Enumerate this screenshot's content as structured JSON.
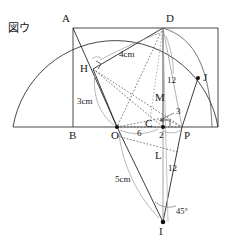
{
  "figure": {
    "tag": "図ウ",
    "caption_position": "top-left"
  },
  "colors": {
    "stroke_solid": "#262626",
    "stroke_dashed": "#555555",
    "stroke_gray": "#9a9a9a",
    "point_fill": "#111111",
    "background": "#ffffff"
  },
  "points": [
    {
      "id": "A",
      "label": "A",
      "x": 73,
      "y": 27,
      "dot": false,
      "label_dx": -11,
      "label_dy": -13
    },
    {
      "id": "D",
      "label": "D",
      "x": 163,
      "y": 28,
      "dot": false,
      "label_dx": 3,
      "label_dy": -14
    },
    {
      "id": "H",
      "label": "H",
      "x": 93,
      "y": 69,
      "dot": false,
      "label_dx": -12,
      "label_dy": -5
    },
    {
      "id": "J",
      "label": "J",
      "x": 198,
      "y": 78,
      "dot": true,
      "label_dx": 4,
      "label_dy": -5
    },
    {
      "id": "M",
      "label": "M",
      "x": 160,
      "y": 104,
      "dot": false,
      "label_dx": -4,
      "label_dy": -12
    },
    {
      "id": "C",
      "label": "C",
      "x": 156,
      "y": 126,
      "dot": true,
      "label_dx": -11,
      "label_dy": -5
    },
    {
      "id": "B",
      "label": "B",
      "x": 73,
      "y": 127,
      "dot": false,
      "label_dx": -4,
      "label_dy": 3
    },
    {
      "id": "O",
      "label": "O",
      "x": 117,
      "y": 127,
      "dot": true,
      "label_dx": -5,
      "label_dy": 3
    },
    {
      "id": "P",
      "label": "P",
      "x": 182,
      "y": 127,
      "dot": false,
      "label_dx": 3,
      "label_dy": 3
    },
    {
      "id": "L",
      "label": "L",
      "x": 158,
      "y": 158,
      "dot": false,
      "label_dx": -3,
      "label_dy": -5
    },
    {
      "id": "I",
      "label": "I",
      "x": 163,
      "y": 222,
      "dot": true,
      "label_dx": -3,
      "label_dy": 4
    }
  ],
  "measurements": [
    {
      "id": "m-4cm",
      "text": "4cm",
      "x": 122,
      "y": 56,
      "kind": "length"
    },
    {
      "id": "m-3cm",
      "text": "3cm",
      "x": 84,
      "y": 102,
      "kind": "length"
    },
    {
      "id": "m-5cm",
      "text": "5cm",
      "x": 122,
      "y": 180,
      "kind": "length"
    },
    {
      "id": "m-12up",
      "text": "12",
      "x": 170,
      "y": 81,
      "kind": "length"
    },
    {
      "id": "m-3",
      "text": "3",
      "x": 175,
      "y": 112,
      "kind": "length"
    },
    {
      "id": "m-6",
      "text": "6",
      "x": 138,
      "y": 133,
      "kind": "length"
    },
    {
      "id": "m-2",
      "text": "2",
      "x": 159,
      "y": 134,
      "kind": "length"
    },
    {
      "id": "m-12dn",
      "text": "12",
      "x": 170,
      "y": 168,
      "kind": "length"
    },
    {
      "id": "m-45",
      "text": "45°",
      "x": 175,
      "y": 211,
      "kind": "angle"
    }
  ],
  "marks": {
    "right_angle_at_H": true,
    "right_angle_at_C": true,
    "angle_arc_at_I": true
  },
  "segments": {
    "solid": [
      {
        "name": "baseline",
        "from": "left-end",
        "to": "right-end"
      },
      {
        "name": "AB-vertical"
      },
      {
        "name": "AD-top"
      },
      {
        "name": "AO"
      },
      {
        "name": "DH"
      },
      {
        "name": "HO"
      },
      {
        "name": "DC-vertical"
      },
      {
        "name": "DP-arc-chord"
      },
      {
        "name": "OI"
      },
      {
        "name": "PI"
      },
      {
        "name": "CI"
      },
      {
        "name": "PJ"
      }
    ],
    "dashed": [
      {
        "name": "DO"
      },
      {
        "name": "HC"
      },
      {
        "name": "HM"
      },
      {
        "name": "MP"
      },
      {
        "name": "OL"
      },
      {
        "name": "LP"
      },
      {
        "name": "DL"
      },
      {
        "name": "CP-short"
      }
    ],
    "arcs": [
      {
        "name": "semicircle-main"
      },
      {
        "name": "arc-DJ-small"
      },
      {
        "name": "brace-HO-3cm"
      },
      {
        "name": "brace-DH-4cm"
      },
      {
        "name": "brace-OI-5cm"
      },
      {
        "name": "brace-OC-6"
      },
      {
        "name": "brace-CP-2"
      }
    ]
  }
}
